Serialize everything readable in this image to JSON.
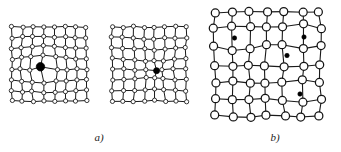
{
  "figure": {
    "type": "diagram",
    "background_color": "#ffffff",
    "line_color": "#1a1a1a",
    "atom_fill_color": "#ffffff",
    "defect_fill_color": "#000000",
    "width": 341,
    "height": 152
  },
  "panels": [
    {
      "id": "panel-a",
      "label": "a)",
      "label_x": 99,
      "label_y": 141,
      "lattices": [
        {
          "id": "lattice-a1",
          "rows": 8,
          "cols": 8,
          "origin_x": 12,
          "origin_y": 27,
          "spacing": 10.6,
          "atom_radius": 2.1,
          "bond_width": 1.0,
          "distortion_mode": "contraction",
          "defect": {
            "type": "substitutional-large-atom",
            "row": 4,
            "col": 3,
            "radius": 4.2,
            "filled": true
          }
        },
        {
          "id": "lattice-a2",
          "rows": 8,
          "cols": 8,
          "origin_x": 112,
          "origin_y": 27,
          "spacing": 10.6,
          "atom_radius": 2.1,
          "bond_width": 1.0,
          "distortion_mode": "dilation",
          "defect": {
            "type": "substitutional-small-atom",
            "row": 4,
            "col": 4,
            "radius": 3.0,
            "filled": true
          }
        }
      ]
    },
    {
      "id": "panel-b",
      "label": "b)",
      "label_x": 275,
      "label_y": 141,
      "lattices": [
        {
          "id": "lattice-b1",
          "rows": 7,
          "cols": 7,
          "origin_x": 215,
          "origin_y": 12,
          "spacing": 17.4,
          "atom_radius": 4.0,
          "bond_width": 1.1,
          "distortion_mode": "interstitial",
          "interstitials": [
            {
              "id": "interstitial-1",
              "x": 234.5,
              "y": 38.0,
              "radius": 2.2
            },
            {
              "id": "interstitial-2",
              "x": 304.0,
              "y": 37.0,
              "radius": 2.2
            },
            {
              "id": "interstitial-3",
              "x": 287.0,
              "y": 55.5,
              "radius": 2.2
            },
            {
              "id": "interstitial-4",
              "x": 300.0,
              "y": 94.0,
              "radius": 2.2
            }
          ]
        }
      ]
    }
  ]
}
